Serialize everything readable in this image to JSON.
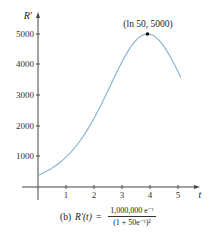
{
  "chart_data": {
    "type": "line",
    "title": "",
    "caption": "(b) R'(t) = 1,000,000 e^-t / (1 + 50e^-t)^2",
    "xlabel": "t",
    "ylabel": "R'",
    "xlim": [
      0,
      5.3
    ],
    "ylim": [
      0,
      5200
    ],
    "xticks": [
      1,
      2,
      3,
      4,
      5
    ],
    "yticks": [
      1000,
      2000,
      3000,
      4000,
      5000
    ],
    "grid": false,
    "legend": null,
    "series": [
      {
        "name": "R'(t)",
        "color": "#7fb3d0",
        "x": [
          0,
          0.5,
          1,
          1.5,
          2,
          2.5,
          3,
          3.5,
          3.912,
          4.5,
          5.1
        ],
        "y": [
          384,
          612,
          961,
          1484,
          2230,
          3185,
          4175,
          4855,
          5000,
          4630,
          3770
        ]
      }
    ],
    "annotations": [
      {
        "label": "(ln 50, 5000)",
        "x": 3.912,
        "y": 5000,
        "marker": "point"
      }
    ]
  },
  "axes": {
    "y_label": "R′",
    "x_label": "t",
    "x_tick_labels": [
      "1",
      "2",
      "3",
      "4",
      "5"
    ],
    "y_tick_labels": [
      "1000",
      "2000",
      "3000",
      "4000",
      "5000"
    ]
  },
  "annotation": {
    "label": "(ln 50, 5000)"
  },
  "caption": {
    "prefix": "(b)",
    "func": "R′(t)",
    "equals": "=",
    "numerator": "1,000,000 e⁻ᵗ",
    "denominator": "(1 + 50e⁻ᵗ)²"
  },
  "colors": {
    "curve": "#7fb3d0",
    "axis": "#444444",
    "point": "#111111"
  }
}
